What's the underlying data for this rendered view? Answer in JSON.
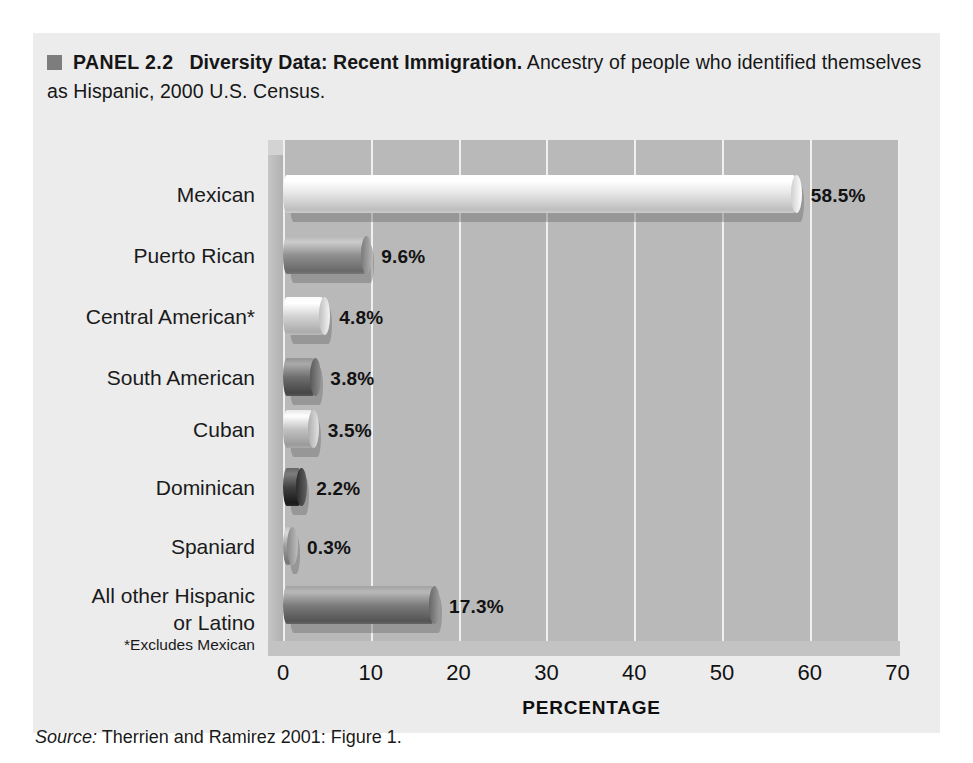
{
  "caption": {
    "bullet": "square-bullet",
    "panel_label": "PANEL 2.2",
    "bold_title": "Diversity Data: Recent Immigration.",
    "rest": " Ancestry of people who identified themselves as Hispanic, 2000 U.S. Census."
  },
  "footnote": "*Excludes Mexican",
  "source": {
    "label": "Source:",
    "text": " Therrien and Ramirez 2001: Figure 1."
  },
  "chart_data": {
    "type": "bar",
    "orientation": "horizontal",
    "title": "Diversity Data: Recent Immigration",
    "subtitle": "Ancestry of people who identified themselves as Hispanic, 2000 U.S. Census.",
    "xlabel": "PERCENTAGE",
    "ylabel": "",
    "xlim": [
      0,
      70
    ],
    "xticks": [
      "0",
      "10",
      "20",
      "30",
      "40",
      "50",
      "60",
      "70"
    ],
    "grid": "vertical",
    "legend": "none",
    "categories": [
      "Mexican",
      "Puerto Rican",
      "Central American*",
      "South American",
      "Cuban",
      "Dominican",
      "Spaniard",
      "All other Hispanic\nor Latino"
    ],
    "values": [
      58.5,
      9.6,
      4.8,
      3.8,
      3.5,
      2.2,
      0.3,
      17.3
    ],
    "value_labels": [
      "58.5%",
      "9.6%",
      "4.8%",
      "3.8%",
      "3.5%",
      "2.2%",
      "0.3%",
      "17.3%"
    ],
    "bar_colors": [
      "#e3e3e3",
      "#8e8e8e",
      "#d2d2d2",
      "#6c6c6c",
      "#c0c0c0",
      "#3f3f3f",
      "#9b9b9b",
      "#7a7a7a"
    ],
    "plot_bg": "#b9b9b9",
    "gridline_color": "#f0f0f0",
    "panel_bg": "#ececed"
  }
}
